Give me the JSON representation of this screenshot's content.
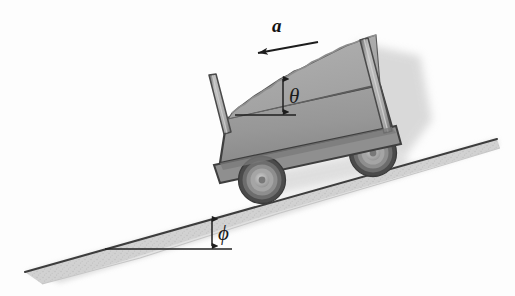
{
  "figure": {
    "name": "cart-of-sand-on-incline",
    "background_color": "#fdfdfd"
  },
  "labels": {
    "acceleration": "a",
    "sand_angle": "θ",
    "incline_angle": "ϕ"
  },
  "annotations": {
    "acceleration_arrow_name": "acceleration-vector-arrow",
    "theta_arrow_name": "theta-angle-indicator",
    "phi_arrow_name": "phi-angle-indicator",
    "theta_reference_name": "theta-horizontal-reference-line",
    "phi_reference_name": "phi-horizontal-reference-line"
  },
  "colors": {
    "outline": "#3b3b3b",
    "cart_body": "#9a9a9a",
    "cart_body_dark": "#7e7e7e",
    "cart_bed": "#8c8c8c",
    "sand_fill": "#a6a6a6",
    "sand_fill_light": "#b4b4b4",
    "post": "#b0b0b0",
    "post_edge": "#6f6f6f",
    "incline_fill": "#cfcfcf",
    "incline_edge": "#474747",
    "wheel_tire": "#4a4a4a",
    "wheel_rim": "#8d8d8d",
    "wheel_hub": "#b9b9b9",
    "shadow": "#c8c8c8",
    "label_text": "#1a1a1a"
  },
  "geometry": {
    "incline_angle_deg": 12,
    "sand_surface_angle_deg": 24,
    "cart_tilt_deg": 12,
    "incline_tip_left": [
      25,
      272
    ],
    "incline_tip_right": [
      497,
      139
    ],
    "front_wheel_center": [
      262,
      180
    ],
    "rear_wheel_center": [
      373,
      153
    ],
    "acceleration_arrow_from": [
      317,
      42
    ],
    "acceleration_arrow_to": [
      254,
      53
    ]
  }
}
